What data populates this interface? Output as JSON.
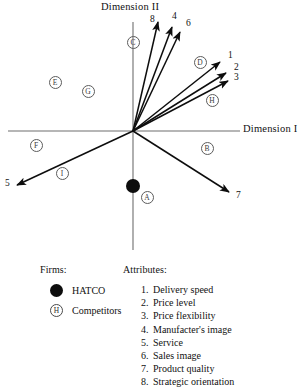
{
  "figure": {
    "axes": {
      "x_label": "Dimension I",
      "y_label": "Dimension II"
    }
  },
  "chart_data": {
    "type": "scatter",
    "title": "",
    "xlabel": "Dimension I",
    "ylabel": "Dimension II",
    "grid": false,
    "legend_position": "bottom",
    "origin_px": [
      133,
      131
    ],
    "vectors": [
      {
        "label": "8",
        "angle_deg": 76,
        "length": 112,
        "label_pos": [
          150,
          14
        ],
        "tip": [
          158,
          22
        ]
      },
      {
        "label": "4",
        "angle_deg": 70,
        "length": 107,
        "label_pos": [
          172,
          11
        ],
        "tip": [
          172,
          27
        ]
      },
      {
        "label": "6",
        "angle_deg": 67,
        "length": 103,
        "label_pos": [
          186,
          18
        ],
        "tip": [
          180,
          32
        ]
      },
      {
        "label": "1",
        "angle_deg": 37,
        "length": 109,
        "label_pos": [
          228,
          50
        ],
        "tip": [
          220,
          62
        ]
      },
      {
        "label": "2",
        "angle_deg": 31,
        "length": 108,
        "label_pos": [
          234,
          62
        ],
        "tip": [
          226,
          73
        ]
      },
      {
        "label": "3",
        "angle_deg": 27,
        "length": 106,
        "label_pos": [
          234,
          72
        ],
        "tip": [
          228,
          81
        ]
      },
      {
        "label": "5",
        "angle_deg": 205,
        "length": 128,
        "label_pos": [
          5,
          178
        ],
        "tip": [
          17,
          185
        ]
      },
      {
        "label": "7",
        "angle_deg": 321,
        "length": 132,
        "label_pos": [
          236,
          190
        ],
        "tip": [
          229,
          192
        ]
      }
    ],
    "firms": [
      {
        "label": "HATCO",
        "type": "hatco",
        "pos": [
          133,
          186
        ]
      },
      {
        "label": "A",
        "type": "competitor",
        "pos": [
          147,
          197
        ]
      },
      {
        "label": "B",
        "type": "competitor",
        "pos": [
          207,
          148
        ]
      },
      {
        "label": "C",
        "type": "competitor",
        "pos": [
          133,
          42
        ]
      },
      {
        "label": "D",
        "type": "competitor",
        "pos": [
          200,
          62
        ]
      },
      {
        "label": "E",
        "type": "competitor",
        "pos": [
          55,
          82
        ]
      },
      {
        "label": "F",
        "type": "competitor",
        "pos": [
          36,
          145
        ]
      },
      {
        "label": "G",
        "type": "competitor",
        "pos": [
          88,
          91
        ]
      },
      {
        "label": "H",
        "type": "competitor",
        "pos": [
          212,
          100
        ]
      },
      {
        "label": "I",
        "type": "competitor",
        "pos": [
          62,
          173
        ]
      }
    ]
  },
  "legend": {
    "firms": {
      "heading": "Firms:",
      "items": [
        {
          "marker": "",
          "label": "HATCO"
        },
        {
          "marker": "H",
          "label": "Competitors"
        }
      ]
    },
    "attributes": {
      "heading": "Attributes:",
      "items": [
        {
          "num": "1.",
          "label": "Delivery speed"
        },
        {
          "num": "2.",
          "label": "Price level"
        },
        {
          "num": "3.",
          "label": "Price flexibility"
        },
        {
          "num": "4.",
          "label": "Manufacter's image"
        },
        {
          "num": "5.",
          "label": "Service"
        },
        {
          "num": "6.",
          "label": "Sales image"
        },
        {
          "num": "7.",
          "label": "Product quality"
        },
        {
          "num": "8.",
          "label": "Strategic orientation"
        }
      ]
    }
  }
}
